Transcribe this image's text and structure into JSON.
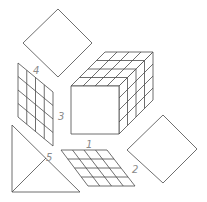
{
  "diagram": {
    "colors": {
      "line": "#4a4a4a",
      "label": "#8a8a8a",
      "background": "#ffffff"
    },
    "labels": [
      {
        "id": "1",
        "text": "1",
        "x": 86,
        "y": 148
      },
      {
        "id": "2",
        "text": "2",
        "x": 132,
        "y": 173
      },
      {
        "id": "3",
        "text": "3",
        "x": 58,
        "y": 120
      },
      {
        "id": "4",
        "text": "4",
        "x": 33,
        "y": 74
      },
      {
        "id": "5",
        "text": "5",
        "x": 46,
        "y": 161
      }
    ],
    "shapes": {
      "cube": {
        "front": [
          71,
          86,
          48,
          48
        ],
        "depth": [
          34,
          -34
        ],
        "grid": 4
      },
      "diamond_top": {
        "points": [
          [
            58,
            9
          ],
          [
            92,
            43
          ],
          [
            58,
            77
          ],
          [
            23,
            43
          ]
        ]
      },
      "diamond_right": {
        "points": [
          [
            163,
            115
          ],
          [
            197,
            149
          ],
          [
            163,
            183
          ],
          [
            127,
            150
          ]
        ]
      },
      "grid_left": {
        "corners": [
          [
            18,
            63
          ],
          [
            53,
            92
          ],
          [
            53,
            146
          ],
          [
            18,
            117
          ]
        ],
        "cols": 4,
        "rows": 4
      },
      "grid_bottom": {
        "corners": [
          [
            61,
            150
          ],
          [
            107,
            150
          ],
          [
            135,
            186
          ],
          [
            88,
            186
          ]
        ],
        "cols": 4,
        "rows": 4
      },
      "triangle": {
        "points": [
          [
            12,
            125
          ],
          [
            12,
            192
          ],
          [
            80,
            192
          ]
        ],
        "inner": [
          [
            12,
            192
          ],
          [
            46,
            158
          ]
        ]
      }
    }
  }
}
